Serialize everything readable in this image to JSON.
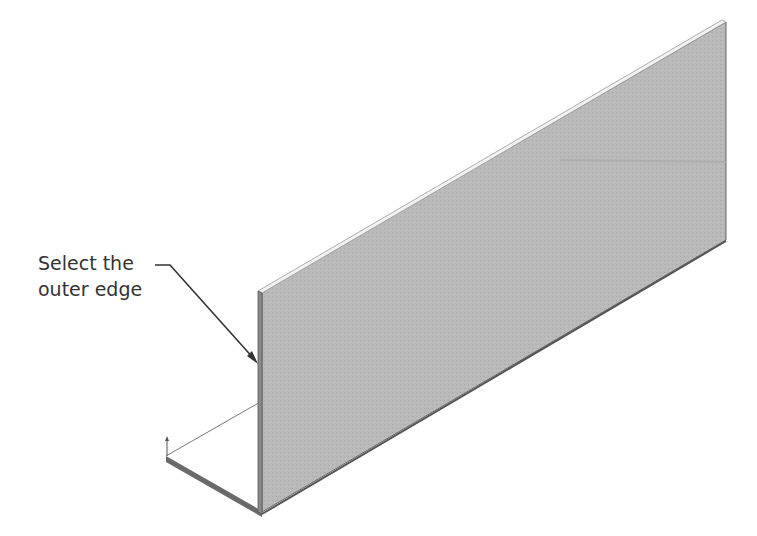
{
  "figure": {
    "type": "sheet-metal-angle-part",
    "callout": {
      "line1": "Select the",
      "line2": "outer edge"
    },
    "colors": {
      "face": "#b8b8b8",
      "edge": "#555555",
      "flange": "#ffffff",
      "text": "#333333"
    }
  }
}
